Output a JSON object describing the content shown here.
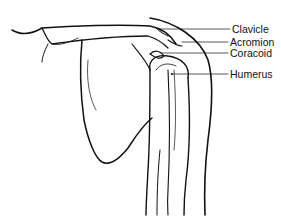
{
  "diagram": {
    "labels": [
      {
        "text": "Clavicle",
        "x": 232,
        "y": 25
      },
      {
        "text": "Acromion",
        "x": 230,
        "y": 37
      },
      {
        "text": "Coracoid",
        "x": 230,
        "y": 48
      },
      {
        "text": "Humerus",
        "x": 230,
        "y": 69
      }
    ],
    "colors": {
      "line": "#111111",
      "background": "#ffffff"
    }
  }
}
